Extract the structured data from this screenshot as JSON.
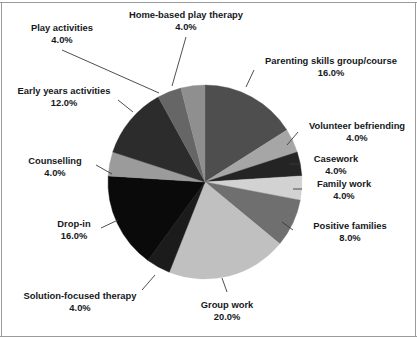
{
  "chart_data": {
    "type": "pie",
    "title": "",
    "subtitle": "",
    "xlabel": "",
    "ylabel": "",
    "grid": false,
    "legend_position": "none",
    "label_format": "name + percentage",
    "start_angle_deg": 0,
    "direction": "clockwise",
    "total_percent": 100.0,
    "categories": [
      "Parenting skills group/course",
      "Volunteer befriending",
      "Casework",
      "Family work",
      "Positive families",
      "Group work",
      "Solution-focused therapy",
      "Drop-in",
      "Counselling",
      "Early years activities",
      "Play activities",
      "Home-based play therapy"
    ],
    "values": [
      16.0,
      4.0,
      4.0,
      4.0,
      8.0,
      20.0,
      4.0,
      16.0,
      4.0,
      12.0,
      4.0,
      4.0
    ],
    "value_labels": [
      "16.0%",
      "4.0%",
      "4.0%",
      "4.0%",
      "8.0%",
      "20.0%",
      "4.0%",
      "16.0%",
      "4.0%",
      "12.0%",
      "4.0%",
      "4.0%"
    ],
    "colors": [
      "#4e4e4e",
      "#a6a6a6",
      "#242424",
      "#d2d2d2",
      "#6f6f6f",
      "#c0c0c0",
      "#1b1b1b",
      "#0a0a0a",
      "#9b9b9b",
      "#2c2c2c",
      "#666666",
      "#8f8f8f"
    ],
    "slices": [
      {
        "label": "Parenting skills group/course",
        "value": 16.0,
        "value_label": "16.0%",
        "color": "#4e4e4e"
      },
      {
        "label": "Volunteer befriending",
        "value": 4.0,
        "value_label": "4.0%",
        "color": "#a6a6a6"
      },
      {
        "label": "Casework",
        "value": 4.0,
        "value_label": "4.0%",
        "color": "#242424"
      },
      {
        "label": "Family work",
        "value": 4.0,
        "value_label": "4.0%",
        "color": "#d2d2d2"
      },
      {
        "label": "Positive families",
        "value": 8.0,
        "value_label": "8.0%",
        "color": "#6f6f6f"
      },
      {
        "label": "Group work",
        "value": 20.0,
        "value_label": "20.0%",
        "color": "#c0c0c0"
      },
      {
        "label": "Solution-focused therapy",
        "value": 4.0,
        "value_label": "4.0%",
        "color": "#1b1b1b"
      },
      {
        "label": "Drop-in",
        "value": 16.0,
        "value_label": "16.0%",
        "color": "#0a0a0a"
      },
      {
        "label": "Counselling",
        "value": 4.0,
        "value_label": "4.0%",
        "color": "#9b9b9b"
      },
      {
        "label": "Early years activities",
        "value": 12.0,
        "value_label": "12.0%",
        "color": "#2c2c2c"
      },
      {
        "label": "Play activities",
        "value": 4.0,
        "value_label": "4.0%",
        "color": "#666666"
      },
      {
        "label": "Home-based play therapy",
        "value": 4.0,
        "value_label": "4.0%",
        "color": "#8f8f8f"
      }
    ]
  },
  "labels": {
    "play_activities": {
      "name": "Play activities",
      "pct": "4.0%"
    },
    "home_based_play_therapy": {
      "name": "Home-based play therapy",
      "pct": "4.0%"
    },
    "parenting_skills": {
      "name": "Parenting skills group/course",
      "pct": "16.0%"
    },
    "early_years_activities": {
      "name": "Early years activities",
      "pct": "12.0%"
    },
    "volunteer_befriending": {
      "name": "Volunteer befriending",
      "pct": "4.0%"
    },
    "counselling": {
      "name": "Counselling",
      "pct": "4.0%"
    },
    "casework": {
      "name": "Casework",
      "pct": "4.0%"
    },
    "family_work": {
      "name": "Family work",
      "pct": "4.0%"
    },
    "drop_in": {
      "name": "Drop-in",
      "pct": "16.0%"
    },
    "positive_families": {
      "name": "Positive families",
      "pct": "8.0%"
    },
    "solution_focused_therapy": {
      "name": "Solution-focused therapy",
      "pct": "4.0%"
    },
    "group_work": {
      "name": "Group work",
      "pct": "20.0%"
    }
  },
  "geometry": {
    "center_x": 205,
    "center_y": 182,
    "radius": 97
  },
  "colors": {
    "background": "#ffffff",
    "text": "#15191c",
    "leader_line": "#3a3a3a",
    "frame": "#9a9a9a"
  }
}
